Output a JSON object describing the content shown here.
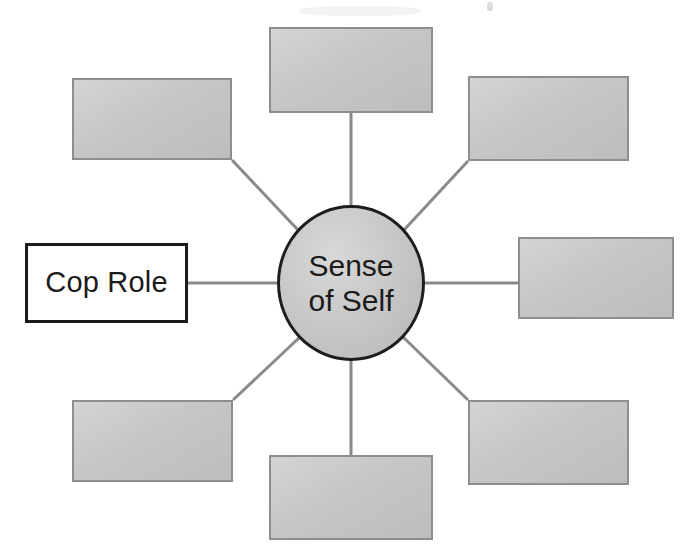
{
  "diagram": {
    "type": "spider-concept-map",
    "center": {
      "name": "sense-of-self",
      "label": "Sense\nof Self",
      "shape": "ellipse",
      "fill_color": "#c9c9c9",
      "border_color": "#1d1d1d",
      "cx": 351,
      "cy": 283,
      "rx": 74,
      "ry": 78
    },
    "node_style": {
      "filled_fill_color": "#c9c9c9",
      "filled_border_color": "#8e8e8e",
      "outlined_fill_color": "#ffffff",
      "outlined_border_color": "#1b1b1b",
      "connector_color": "#8a8a8a",
      "background_color": "#ffffff"
    },
    "nodes": [
      {
        "name": "node-top",
        "label": "",
        "style": "filled",
        "position": "top",
        "x": 269,
        "y": 27,
        "width": 164,
        "height": 86
      },
      {
        "name": "node-top-left",
        "label": "",
        "style": "filled",
        "position": "top-left",
        "x": 72,
        "y": 78,
        "width": 160,
        "height": 82
      },
      {
        "name": "node-top-right",
        "label": "",
        "style": "filled",
        "position": "top-right",
        "x": 468,
        "y": 76,
        "width": 161,
        "height": 85
      },
      {
        "name": "node-left-cop-role",
        "label": "Cop Role",
        "style": "outlined",
        "position": "left",
        "x": 25,
        "y": 243,
        "width": 163,
        "height": 80
      },
      {
        "name": "node-right",
        "label": "",
        "style": "filled",
        "position": "right",
        "x": 518,
        "y": 237,
        "width": 156,
        "height": 82
      },
      {
        "name": "node-bottom-left",
        "label": "",
        "style": "filled",
        "position": "bottom-left",
        "x": 72,
        "y": 400,
        "width": 161,
        "height": 82
      },
      {
        "name": "node-bottom",
        "label": "",
        "style": "filled",
        "position": "bottom",
        "x": 269,
        "y": 455,
        "width": 164,
        "height": 85
      },
      {
        "name": "node-bottom-right",
        "label": "",
        "style": "filled",
        "position": "bottom-right",
        "x": 468,
        "y": 400,
        "width": 161,
        "height": 85
      }
    ],
    "connectors": [
      {
        "name": "connector-top",
        "x1": 351,
        "y1": 205,
        "x2": 351,
        "y2": 113
      },
      {
        "name": "connector-top-left",
        "x1": 298,
        "y1": 230,
        "x2": 232,
        "y2": 160
      },
      {
        "name": "connector-top-right",
        "x1": 404,
        "y1": 230,
        "x2": 468,
        "y2": 161
      },
      {
        "name": "connector-left",
        "x1": 277,
        "y1": 283,
        "x2": 188,
        "y2": 283
      },
      {
        "name": "connector-right",
        "x1": 425,
        "y1": 283,
        "x2": 518,
        "y2": 283
      },
      {
        "name": "connector-bottom-left",
        "x1": 300,
        "y1": 337,
        "x2": 233,
        "y2": 400
      },
      {
        "name": "connector-bottom",
        "x1": 351,
        "y1": 361,
        "x2": 351,
        "y2": 455
      },
      {
        "name": "connector-bottom-right",
        "x1": 403,
        "y1": 337,
        "x2": 468,
        "y2": 400
      }
    ]
  }
}
